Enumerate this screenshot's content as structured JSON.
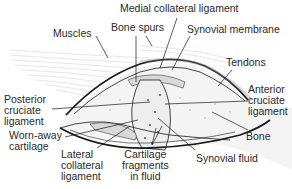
{
  "diagram": {
    "labels": {
      "medial_collateral_ligament": "Medial collateral ligament",
      "bone_spurs": "Bone spurs",
      "synovial_membrane": "Synovial membrane",
      "muscles": "Muscles",
      "tendons": "Tendons",
      "anterior_cruciate_ligament": "Anterior\ncruciate\nligament",
      "posterior_cruciate_ligament": "Posterior\ncruciate\nligament",
      "worn_away_cartilage": "Worn-away\ncartilage",
      "bone": "Bone",
      "lateral_collateral_ligament": "Lateral\ncollateral\nligament",
      "cartilage_fragments": "Cartilage\nfragments\nin fluid",
      "synovial_fluid": "Synovial fluid"
    },
    "colors": {
      "outline": "#1a1a1a",
      "text": "#2a2a2a",
      "tissue_fill": "#d9d9d9",
      "muscle_lines": "#c8c8c8",
      "bone_fill": "#f4f4f4"
    }
  }
}
